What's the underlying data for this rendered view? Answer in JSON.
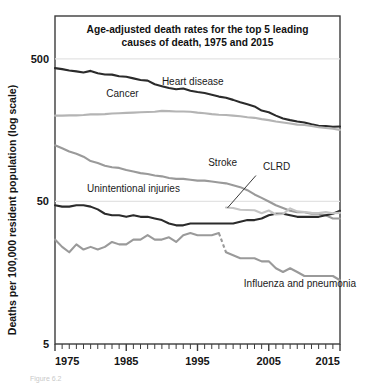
{
  "figure": {
    "caption": "Figure 6.2"
  },
  "chart_data": {
    "type": "line",
    "title": "Age-adjusted death rates for the top 5 leading causes of death, 1975 and 2015",
    "title_line1": "Age-adjusted death rates for the top 5 leading",
    "title_line2": "causes of death, 1975 and 2015",
    "xlabel": "",
    "ylabel": "Deaths per 100,000 resident population (log scale)",
    "yscale": "log",
    "ylim": [
      5,
      1000
    ],
    "xlim": [
      1975,
      2015
    ],
    "ytick_values": [
      5,
      50,
      500
    ],
    "ytick_labels": [
      "5",
      "50",
      "500"
    ],
    "gridlines": [
      50,
      500
    ],
    "grid": true,
    "xtick_major": [
      1975,
      1985,
      1995,
      2005,
      2015
    ],
    "xtick_major_labels": [
      "1975",
      "1985",
      "1995",
      "2005",
      "2015"
    ],
    "xtick_minor_step": 1,
    "legend_position": "inline-annotations",
    "colors": {
      "dark": "#2b2b2b",
      "mid": "#9a9a9a",
      "light": "#c4c4c4",
      "grid": "#e3e3e3",
      "axis": "#3c3c3c"
    },
    "x": [
      1975,
      1976,
      1977,
      1978,
      1979,
      1980,
      1981,
      1982,
      1983,
      1984,
      1985,
      1986,
      1987,
      1988,
      1989,
      1990,
      1991,
      1992,
      1993,
      1994,
      1995,
      1996,
      1997,
      1998,
      1999,
      2000,
      2001,
      2002,
      2003,
      2004,
      2005,
      2006,
      2007,
      2008,
      2009,
      2010,
      2011,
      2012,
      2013,
      2014,
      2015
    ],
    "series": [
      {
        "name": "Heart disease",
        "label": "Heart disease",
        "color": "#2b2b2b",
        "width": 2.1,
        "label_x": 1990,
        "label_y": 330,
        "values": [
          431,
          424,
          415,
          409,
          401,
          412,
          397,
          389,
          388,
          378,
          375,
          365,
          356,
          352,
          332,
          322,
          313,
          306,
          310,
          299,
          293,
          288,
          280,
          272,
          267,
          258,
          248,
          240,
          232,
          217,
          211,
          200,
          191,
          186,
          182,
          179,
          174,
          170,
          169,
          167,
          168
        ]
      },
      {
        "name": "Cancer",
        "label": "Cancer",
        "color": "#b4b4b4",
        "width": 2.1,
        "label_x": 1982.2,
        "label_y": 270,
        "values": [
          200,
          200,
          201,
          201,
          202,
          204,
          204,
          205,
          207,
          208,
          209,
          210,
          211,
          212,
          213,
          216,
          215,
          214,
          214,
          213,
          210,
          208,
          205,
          203,
          202,
          200,
          198,
          195,
          193,
          189,
          186,
          182,
          179,
          176,
          173,
          172,
          169,
          166,
          164,
          162,
          159
        ]
      },
      {
        "name": "Stroke",
        "label": "Stroke",
        "color": "#9a9a9a",
        "width": 2.1,
        "label_x": 1996.5,
        "label_y": 88,
        "values": [
          124,
          118,
          112,
          108,
          103,
          96,
          93,
          89,
          87,
          86,
          83,
          81,
          79,
          78,
          76,
          75,
          73,
          72,
          72,
          71,
          70,
          70,
          69,
          68,
          67,
          65,
          63,
          60,
          56,
          53,
          50,
          47,
          45,
          43,
          42,
          42,
          41,
          41,
          40,
          38,
          38
        ]
      },
      {
        "name": "Unintentional injuries",
        "label": "Unintentional injuries",
        "color": "#2b2b2b",
        "width": 2.1,
        "label_x": 1979.5,
        "label_y": 58,
        "values": [
          47,
          46,
          46,
          47,
          47,
          46,
          44,
          41,
          40,
          40,
          39,
          40,
          39,
          39,
          38,
          37,
          35,
          34,
          34,
          35,
          35,
          35,
          35,
          35,
          35,
          35,
          36,
          37,
          37,
          38,
          40,
          41,
          41,
          40,
          39,
          39,
          39,
          39,
          40,
          41,
          43
        ]
      },
      {
        "name": "Influenza and pneumonia",
        "label": "Influenza and pneumonia",
        "color": "#9a9a9a",
        "width": 2.1,
        "label_x": 2001.5,
        "label_y": 12.5,
        "break_after_year": 1998,
        "values": [
          27,
          24,
          22,
          25,
          23,
          24,
          23,
          24,
          26,
          25,
          25,
          27,
          27,
          29,
          27,
          27,
          28,
          26,
          29,
          30,
          29,
          29,
          29,
          30,
          22,
          21,
          20,
          20,
          20,
          19,
          19,
          17,
          16,
          17,
          16,
          15,
          15,
          15,
          15,
          15,
          14
        ]
      },
      {
        "name": "CLRD",
        "label": "CLRD",
        "color": "#c4c4c4",
        "width": 2.1,
        "label_x": 2004.2,
        "label_y": 83,
        "leader_from_x": 2003.2,
        "leader_from_y": 76,
        "leader_to_x": 1999.2,
        "leader_to_y": 45,
        "values": [
          null,
          null,
          null,
          null,
          null,
          null,
          null,
          null,
          null,
          null,
          null,
          null,
          null,
          null,
          null,
          null,
          null,
          null,
          null,
          null,
          null,
          null,
          null,
          null,
          45.3,
          45,
          43.7,
          43.6,
          43.4,
          41.3,
          43.2,
          40.5,
          40.8,
          44.7,
          42.6,
          42.2,
          41.6,
          41.5,
          42.1,
          41.3,
          41.6
        ]
      }
    ],
    "annotations": [
      {
        "text": "Heart disease",
        "x": 1990,
        "y": 330
      },
      {
        "text": "Cancer",
        "x": 1982.2,
        "y": 270
      },
      {
        "text": "Stroke",
        "x": 1996.5,
        "y": 88
      },
      {
        "text": "CLRD",
        "x": 2004.2,
        "y": 83
      },
      {
        "text": "Unintentional injuries",
        "x": 1979.5,
        "y": 58
      },
      {
        "text": "Influenza and pneumonia",
        "x": 2001.5,
        "y": 12.5
      }
    ]
  }
}
